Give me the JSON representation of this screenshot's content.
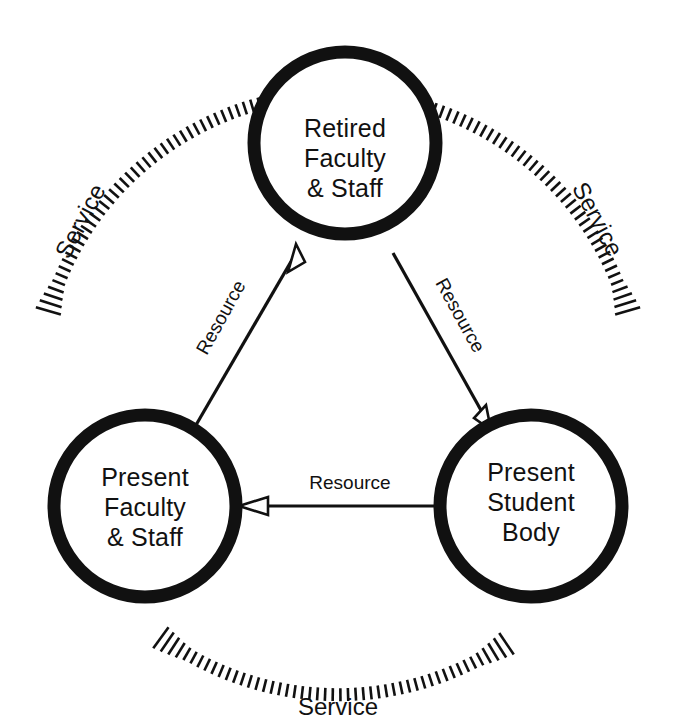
{
  "diagram": {
    "type": "cycle-triad",
    "background_color": "#ffffff",
    "line_color": "#111111",
    "nodes": [
      {
        "id": "retired-faculty-staff",
        "lines": [
          "Retired",
          "Faculty",
          "& Staff"
        ],
        "line1": "Retired",
        "line2": "Faculty",
        "line3": "& Staff",
        "position": "top",
        "cx": 345,
        "cy": 143,
        "r": 91
      },
      {
        "id": "present-faculty-staff",
        "lines": [
          "Present",
          "Faculty",
          "& Staff"
        ],
        "line1": "Present",
        "line2": "Faculty",
        "line3": "& Staff",
        "position": "bottom-left",
        "cx": 145,
        "cy": 506,
        "r": 91
      },
      {
        "id": "present-student-body",
        "lines": [
          "Present",
          "Student",
          "Body"
        ],
        "line1": "Present",
        "line2": "Student",
        "line3": "Body",
        "position": "bottom-right",
        "cx": 531,
        "cy": 506,
        "r": 91
      }
    ],
    "inner_arrows": [
      {
        "id": "resource-pfs-to-rfs",
        "label": "Resource",
        "from": "present-faculty-staff",
        "to": "retired-faculty-staff",
        "label_x": 222,
        "label_y": 318,
        "label_rotation": -61
      },
      {
        "id": "resource-rfs-to-psb",
        "label": "Resource",
        "from": "retired-faculty-staff",
        "to": "present-student-body",
        "label_x": 459,
        "label_y": 316,
        "label_rotation": 61
      },
      {
        "id": "resource-psb-to-pfs",
        "label": "Resource",
        "from": "present-student-body",
        "to": "present-faculty-staff",
        "label_x": 350,
        "label_y": 480,
        "label_rotation": 0
      }
    ],
    "outer_arcs": [
      {
        "id": "service-left",
        "label": "Service",
        "from": "present-faculty-staff",
        "to": "retired-faculty-staff",
        "label_x": 82,
        "label_y": 222,
        "label_rotation": -62
      },
      {
        "id": "service-right",
        "label": "Service",
        "from": "retired-faculty-staff",
        "to": "present-student-body",
        "label_x": 596,
        "label_y": 220,
        "label_rotation": 62
      },
      {
        "id": "service-bottom",
        "label": "Service",
        "from": "present-student-body",
        "to": "present-faculty-staff",
        "label_x": 338,
        "label_y": 709,
        "label_rotation": 0
      }
    ]
  }
}
